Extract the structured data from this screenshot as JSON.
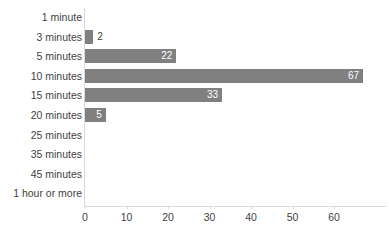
{
  "chart_data": {
    "type": "bar",
    "orientation": "horizontal",
    "title": "",
    "xlabel": "",
    "ylabel": "",
    "categories": [
      "1 minute",
      "3 minutes",
      "5 minutes",
      "10 minutes",
      "15 minutes",
      "20 minutes",
      "25 minutes",
      "35 minutes",
      "45 minutes",
      "1 hour or more"
    ],
    "values": [
      0,
      2,
      22,
      67,
      33,
      5,
      0,
      0,
      0,
      0
    ],
    "value_labels": [
      "",
      "2",
      "22",
      "67",
      "33",
      "5",
      "",
      "",
      "",
      ""
    ],
    "xlim": [
      0,
      72.8
    ],
    "xticks": [
      0,
      10,
      20,
      30,
      40,
      50,
      60
    ],
    "xtick_labels": [
      "0",
      "10",
      "20",
      "30",
      "40",
      "50",
      "60"
    ],
    "grid": false,
    "legend": false,
    "bar_color": "#808080",
    "axis_color": "#d9d9d9",
    "text_color": "#3f3f3f",
    "inside_label_color": "#ffffff"
  }
}
